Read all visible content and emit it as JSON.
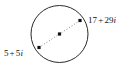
{
  "figure": {
    "type": "geometry-diagram",
    "background_color": "#ffffff",
    "width": 129,
    "height": 72
  },
  "circle": {
    "name": "circle",
    "center_x": 59.5,
    "center_y": 34,
    "radius": 28.5,
    "stroke_color": "#2b2b2b",
    "stroke_width": 1,
    "fill": "none"
  },
  "diameter": {
    "name": "diameter-segment",
    "style": "dotted",
    "stroke_color": "#8a8a8a",
    "stroke_width": 1,
    "dash_pattern": "1 2"
  },
  "points": [
    {
      "id": "upper-right-endpoint",
      "x": 80,
      "y": 20.5,
      "marker": "square-dot",
      "color": "#111111",
      "size": 3.2,
      "label": "17 + 29i",
      "label_real": "17",
      "label_operator": "+",
      "label_imaginary_coefficient": "29",
      "label_imaginary_unit": "i"
    },
    {
      "id": "center-point",
      "x": 59.5,
      "y": 34,
      "marker": "square-dot",
      "color": "#111111",
      "size": 3.2,
      "label": ""
    },
    {
      "id": "lower-left-endpoint",
      "x": 39,
      "y": 47.5,
      "marker": "square-dot",
      "color": "#111111",
      "size": 3.2,
      "label": "5 + 5i",
      "label_real": "5",
      "label_operator": "+",
      "label_imaginary_coefficient": "5",
      "label_imaginary_unit": "i"
    }
  ],
  "labels": {
    "upper_right": {
      "real": "17",
      "operator": "+",
      "imaginary": "29",
      "unit": "i",
      "full": "17 + 29i"
    },
    "lower_left": {
      "real": "5",
      "operator": "+",
      "imaginary": "5",
      "unit": "i",
      "full": "5 + 5i"
    }
  }
}
